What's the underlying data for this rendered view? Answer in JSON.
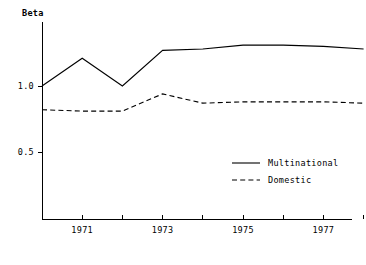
{
  "chart_data": {
    "type": "line",
    "title": "",
    "xlabel": "",
    "ylabel": "Beta",
    "x": [
      1970,
      1971,
      1972,
      1973,
      1974,
      1975,
      1976,
      1977,
      1978
    ],
    "xlim": [
      1970,
      1978
    ],
    "ylim": [
      0.0,
      1.45
    ],
    "grid": false,
    "legend_position": "center-right",
    "y_ticks": [
      {
        "value": 0.5,
        "label": "0.5"
      },
      {
        "value": 1.0,
        "label": "1.0"
      }
    ],
    "x_ticks": [
      {
        "value": 1971,
        "label": "1971"
      },
      {
        "value": 1972,
        "label": ""
      },
      {
        "value": 1973,
        "label": "1973"
      },
      {
        "value": 1974,
        "label": ""
      },
      {
        "value": 1975,
        "label": "1975"
      },
      {
        "value": 1976,
        "label": ""
      },
      {
        "value": 1977,
        "label": "1977"
      },
      {
        "value": 1978,
        "label": ""
      }
    ],
    "series": [
      {
        "name": "Multinational",
        "style": "solid",
        "color": "#000000",
        "values": [
          1.0,
          1.21,
          1.0,
          1.27,
          1.28,
          1.31,
          1.31,
          1.3,
          1.28
        ]
      },
      {
        "name": "Domestic",
        "style": "dashed",
        "color": "#000000",
        "values": [
          0.82,
          0.81,
          0.81,
          0.94,
          0.87,
          0.88,
          0.88,
          0.88,
          0.87
        ]
      }
    ]
  },
  "legend": {
    "items": [
      {
        "label": "Multinational",
        "style": "solid"
      },
      {
        "label": "Domestic",
        "style": "dashed"
      }
    ]
  }
}
